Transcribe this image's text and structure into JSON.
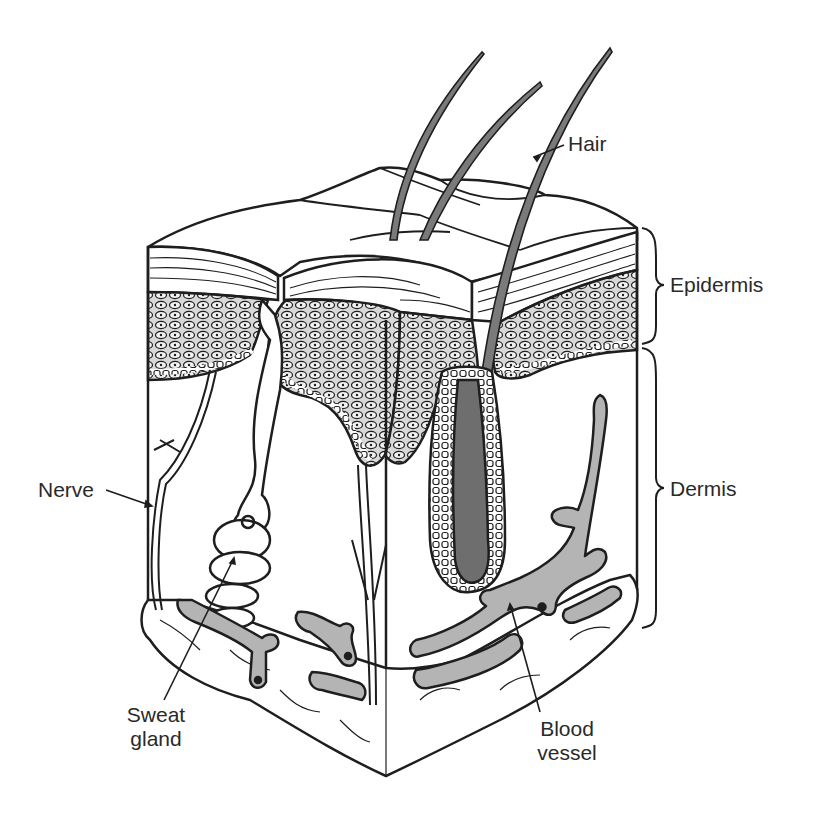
{
  "diagram": {
    "labels": {
      "hair": "Hair",
      "epidermis": "Epidermis",
      "dermis": "Dermis",
      "nerve": "Nerve",
      "sweat_gland_line1": "Sweat",
      "sweat_gland_line2": "gland",
      "blood_vessel_line1": "Blood",
      "blood_vessel_line2": "vessel"
    },
    "colors": {
      "ink": "#1e1e1e",
      "hair_fill": "#7a7a7a",
      "follicle_bulb": "#6e6e6e",
      "vessel_fill": "#b4b4b4",
      "epidermis_cells": "#9a9a9a",
      "background": "#ffffff"
    }
  }
}
